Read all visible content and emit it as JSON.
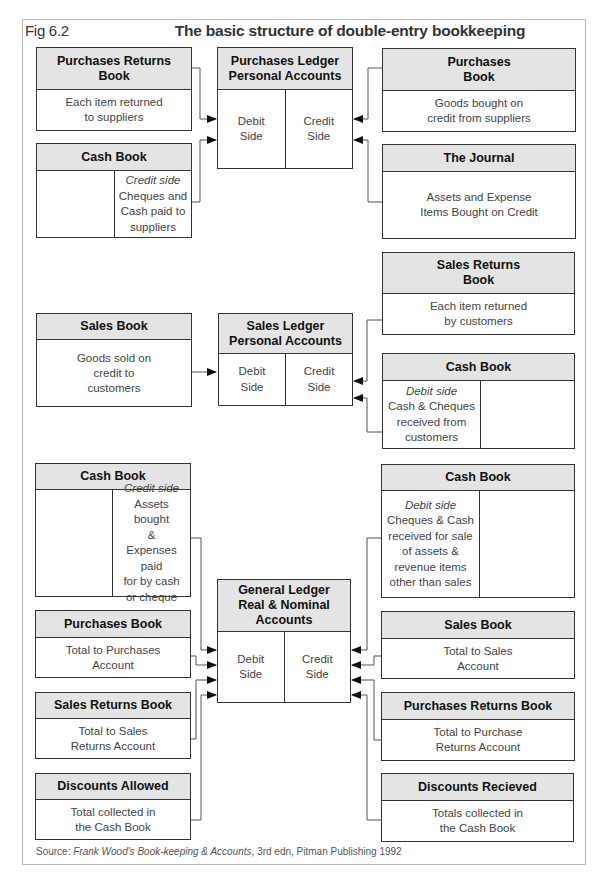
{
  "figure": {
    "label": "Fig 6.2",
    "title": "The basic structure of double-entry bookkeeping"
  },
  "sections": {
    "purchases": {
      "ledger": {
        "title": "Purchases Ledger\nPersonal Accounts",
        "debit": "Debit\nSide",
        "credit": "Credit\nSide"
      },
      "purchases_returns_book": {
        "title": "Purchases Returns\nBook",
        "body": "Each item returned\nto suppliers"
      },
      "cash_book": {
        "title": "Cash Book",
        "credit_label": "Credit side",
        "credit_text": "Cheques and\nCash paid to\nsuppliers",
        "debit_text": ""
      },
      "purchases_book": {
        "title": "Purchases\nBook",
        "body": "Goods bought on\ncredit from suppliers"
      },
      "journal": {
        "title": "The Journal",
        "body": "Assets and Expense\nItems Bought on Credit"
      }
    },
    "sales": {
      "ledger": {
        "title": "Sales Ledger\nPersonal Accounts",
        "debit": "Debit\nSide",
        "credit": "Credit\nSide"
      },
      "sales_book": {
        "title": "Sales Book",
        "body": "Goods sold on\ncredit to\ncustomers"
      },
      "sales_returns_book": {
        "title": "Sales Returns\nBook",
        "body": "Each item returned\nby customers"
      },
      "cash_book": {
        "title": "Cash Book",
        "debit_label": "Debit side",
        "debit_text": "Cash & Cheques\nreceived from\ncustomers",
        "credit_text": ""
      }
    },
    "general": {
      "ledger": {
        "title": "General Ledger\nReal & Nominal\nAccounts",
        "debit": "Debit\nSide",
        "credit": "Credit\nSide"
      },
      "cash_book_left": {
        "title": "Cash Book",
        "credit_label": "Credit side",
        "credit_text": "Assets bought\n&\nExpenses paid\nfor by cash\nor cheque",
        "debit_text": ""
      },
      "purchases_book": {
        "title": "Purchases Book",
        "body": "Total to Purchases\nAccount"
      },
      "sales_returns_book": {
        "title": "Sales Returns Book",
        "body": "Total to Sales\nReturns Account"
      },
      "discounts_allowed": {
        "title": "Discounts Allowed",
        "body": "Total collected in\nthe Cash Book"
      },
      "cash_book_right": {
        "title": "Cash Book",
        "debit_label": "Debit side",
        "debit_text": "Cheques & Cash\nreceived for sale\nof assets &\nrevenue items\nother than sales",
        "credit_text": ""
      },
      "sales_book": {
        "title": "Sales Book",
        "body": "Total to Sales\nAccount"
      },
      "purchases_returns_book": {
        "title": "Purchases Returns Book",
        "body": "Total to Purchase\nReturns Account"
      },
      "discounts_received": {
        "title": "Discounts Recieved",
        "body": "Totals collected in\nthe Cash Book"
      }
    }
  },
  "source": {
    "prefix": "Source: ",
    "work": "Frank Wood's Book-keeping & Accounts",
    "suffix": ", 3rd edn, Pitman Publishing 1992"
  },
  "colors": {
    "header_fill": "#e4e4e4",
    "border": "#333333",
    "connector": "#555555",
    "frame": "#b8b8b8"
  }
}
